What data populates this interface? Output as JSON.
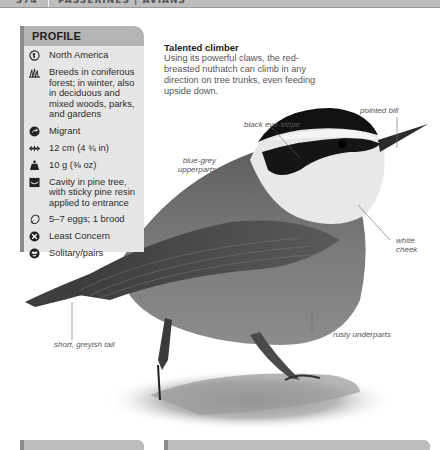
{
  "header": {
    "page_number": "374",
    "section": "PASSERINES | AVIANS"
  },
  "profile": {
    "title": "PROFILE",
    "items": [
      {
        "icon": "globe-icon",
        "text": "North America"
      },
      {
        "icon": "habitat-grass-icon",
        "text": "Breeds in coniferous forest; in winter, also in deciduous and mixed woods, parks, and gardens"
      },
      {
        "icon": "migration-arrow-icon",
        "text": "Migrant"
      },
      {
        "icon": "length-arrows-icon",
        "text": "12 cm (4 ¾ in)"
      },
      {
        "icon": "weight-icon",
        "text": "10 g (⅜ oz)"
      },
      {
        "icon": "nest-icon",
        "text": "Cavity in pine tree, with sticky pine resin applied to entrance"
      },
      {
        "icon": "egg-icon",
        "text": "5–7 eggs; 1 brood"
      },
      {
        "icon": "conservation-status-icon",
        "text": "Least Concern"
      },
      {
        "icon": "social-behaviour-icon",
        "text": "Solitary/pairs"
      }
    ]
  },
  "caption": {
    "title": "Talented climber",
    "body": "Using its powerful claws, the red-breasted nuthatch can climb in any direction on tree trunks, even feeding upside down."
  },
  "annotations": {
    "pointed_bill": "pointed bill",
    "black_eye_stripe": "black eye-stripe",
    "blue_grey_upperparts_1": "blue-grey",
    "blue_grey_upperparts_2": "upperparts",
    "white_cheek_1": "white",
    "white_cheek_2": "cheek",
    "rusty_underparts": "rusty underparts",
    "short_tail": "short, greyish tail"
  },
  "colors": {
    "profile_bg": "#e6e6e6",
    "profile_header": "#b5b5b5",
    "accent_bar": "#8a8a8a",
    "topbar": "#bdbdbd"
  }
}
